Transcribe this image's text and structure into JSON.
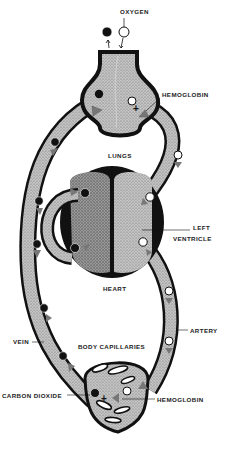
{
  "diagram": {
    "labels": {
      "oxygen": "OXYGEN",
      "hemoglobin_top": "HEMOGLOBIN",
      "lungs": "LUNGS",
      "left_ventricle_line1": "LEFT",
      "left_ventricle_line2": "VENTRICLE",
      "heart": "HEART",
      "artery": "ARTERY",
      "vein": "VEIN",
      "body_capillaries": "BODY CAPILLARIES",
      "carbon_dioxide": "CARBON DIOXIDE",
      "hemoglobin_bottom": "HEMOGLOBIN"
    },
    "symbols": {
      "oxygen": "white-circle",
      "carbon_dioxide": "black-circle",
      "hemoglobin": "gray-triangle",
      "bind": "+"
    },
    "colors": {
      "outline": "#111111",
      "vessel_fill": "#b8b8b8",
      "dark_fill": "#8a8a8a",
      "hemoglobin": "#7a7a7a",
      "background": "#ffffff"
    }
  }
}
